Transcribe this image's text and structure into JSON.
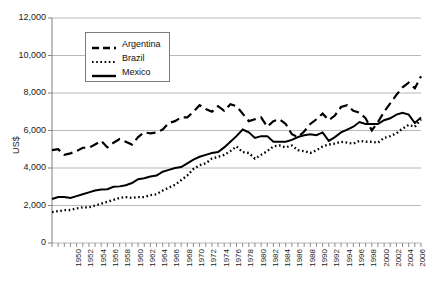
{
  "chart_data": {
    "type": "line",
    "title": "",
    "xlabel": "",
    "ylabel": "US$",
    "ylim": [
      0,
      12000
    ],
    "xlim": [
      1950,
      2010
    ],
    "ytick_labels": [
      "0",
      "2,000",
      "4,000",
      "6,000",
      "8,000",
      "10,000",
      "12,000"
    ],
    "ytick_values": [
      0,
      2000,
      4000,
      6000,
      8000,
      10000,
      12000
    ],
    "grid": "horizontal",
    "legend_position": "upper-left-inset",
    "xtick_labels": [
      "1950",
      "1952",
      "1954",
      "1956",
      "1958",
      "1960",
      "1962",
      "1964",
      "1966",
      "1968",
      "1970",
      "1972",
      "1974",
      "1976",
      "1978",
      "1980",
      "1982",
      "1984",
      "1986",
      "1988",
      "1990",
      "1992",
      "1994",
      "1996",
      "1998",
      "2000",
      "2002",
      "2004",
      "2006",
      "2008",
      "2010"
    ],
    "x": [
      1950,
      1951,
      1952,
      1953,
      1954,
      1955,
      1956,
      1957,
      1958,
      1959,
      1960,
      1961,
      1962,
      1963,
      1964,
      1965,
      1966,
      1967,
      1968,
      1969,
      1970,
      1971,
      1972,
      1973,
      1974,
      1975,
      1976,
      1977,
      1978,
      1979,
      1980,
      1981,
      1982,
      1983,
      1984,
      1985,
      1986,
      1987,
      1988,
      1989,
      1990,
      1991,
      1992,
      1993,
      1994,
      1995,
      1996,
      1997,
      1998,
      1999,
      2000,
      2001,
      2002,
      2003,
      2004,
      2005,
      2006,
      2007,
      2008,
      2009,
      2010
    ],
    "series": [
      {
        "name": "Argentina",
        "style": "dashed",
        "color": "#000000",
        "values": [
          4950,
          5000,
          4700,
          4780,
          4900,
          5080,
          5080,
          5250,
          5450,
          5100,
          5350,
          5550,
          5400,
          5250,
          5650,
          5900,
          5850,
          5900,
          6050,
          6400,
          6500,
          6700,
          6700,
          7000,
          7350,
          7150,
          7000,
          7300,
          7050,
          7400,
          7300,
          6900,
          6500,
          6600,
          6700,
          6200,
          6500,
          6600,
          6350,
          5800,
          5650,
          5950,
          6350,
          6600,
          6900,
          6550,
          6800,
          7250,
          7350,
          7050,
          6950,
          6650,
          6000,
          6450,
          7000,
          7450,
          7900,
          8300,
          8550,
          8250,
          8900
        ]
      },
      {
        "name": "Brazil",
        "style": "dotted",
        "color": "#000000",
        "values": [
          1650,
          1700,
          1750,
          1760,
          1850,
          1900,
          1900,
          2000,
          2100,
          2200,
          2300,
          2400,
          2450,
          2400,
          2450,
          2450,
          2550,
          2600,
          2800,
          2950,
          3100,
          3350,
          3600,
          3950,
          4150,
          4250,
          4500,
          4600,
          4700,
          4900,
          5150,
          4850,
          4800,
          4500,
          4700,
          4900,
          5150,
          5200,
          5100,
          5200,
          4950,
          4900,
          4800,
          4950,
          5150,
          5250,
          5300,
          5400,
          5350,
          5300,
          5450,
          5400,
          5400,
          5350,
          5600,
          5700,
          5850,
          6100,
          6300,
          6200,
          6600
        ]
      },
      {
        "name": "Mexico",
        "style": "solid",
        "color": "#000000",
        "values": [
          2350,
          2450,
          2450,
          2400,
          2500,
          2600,
          2700,
          2800,
          2850,
          2870,
          3000,
          3020,
          3080,
          3200,
          3400,
          3450,
          3550,
          3600,
          3800,
          3900,
          4000,
          4050,
          4250,
          4450,
          4600,
          4700,
          4800,
          4850,
          5100,
          5400,
          5700,
          6050,
          5900,
          5600,
          5700,
          5700,
          5400,
          5400,
          5400,
          5500,
          5650,
          5750,
          5800,
          5750,
          5900,
          5450,
          5650,
          5900,
          6050,
          6200,
          6450,
          6350,
          6350,
          6350,
          6550,
          6650,
          6850,
          6950,
          6850,
          6400,
          6700
        ]
      }
    ]
  },
  "legend": {
    "items": [
      {
        "label": "Argentina",
        "style": "dashed"
      },
      {
        "label": "Brazil",
        "style": "dotted"
      },
      {
        "label": "Mexico",
        "style": "solid"
      }
    ]
  }
}
